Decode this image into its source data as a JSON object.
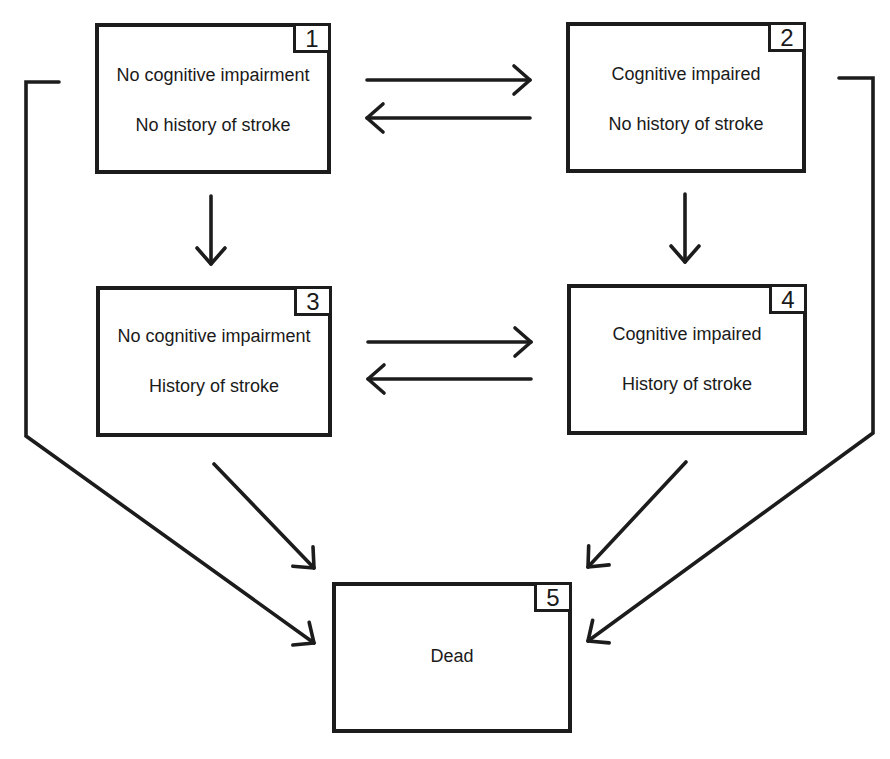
{
  "diagram": {
    "type": "multi-state transition model",
    "states": [
      {
        "id": "1",
        "number": "1",
        "line1": "No cognitive impairment",
        "line2": "No history of stroke"
      },
      {
        "id": "2",
        "number": "2",
        "line1": "Cognitive impaired",
        "line2": "No history of stroke"
      },
      {
        "id": "3",
        "number": "3",
        "line1": "No cognitive impairment",
        "line2": "History of stroke"
      },
      {
        "id": "4",
        "number": "4",
        "line1": "Cognitive impaired",
        "line2": "History of stroke"
      },
      {
        "id": "5",
        "number": "5",
        "line1": "Dead",
        "line2": ""
      }
    ],
    "transitions": [
      {
        "from": "1",
        "to": "2"
      },
      {
        "from": "2",
        "to": "1"
      },
      {
        "from": "3",
        "to": "4"
      },
      {
        "from": "4",
        "to": "3"
      },
      {
        "from": "1",
        "to": "3"
      },
      {
        "from": "2",
        "to": "4"
      },
      {
        "from": "1",
        "to": "5"
      },
      {
        "from": "2",
        "to": "5"
      },
      {
        "from": "3",
        "to": "5"
      },
      {
        "from": "4",
        "to": "5"
      }
    ],
    "colors": {
      "stroke": "#1c1c1c",
      "background": "#ffffff"
    }
  }
}
